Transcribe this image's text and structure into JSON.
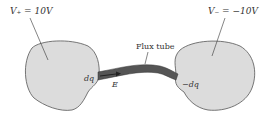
{
  "labels": {
    "v_plus": "V₊ = 10V",
    "v_minus": "V₋ = −10V",
    "flux_tube": "Flux tube",
    "dq": "dq",
    "neg_dq": "−dq",
    "e_field": "E"
  },
  "colors": {
    "blob_fill": "#dcdcdc",
    "blob_stroke": "#555555",
    "tube_fill": "#555555"
  }
}
